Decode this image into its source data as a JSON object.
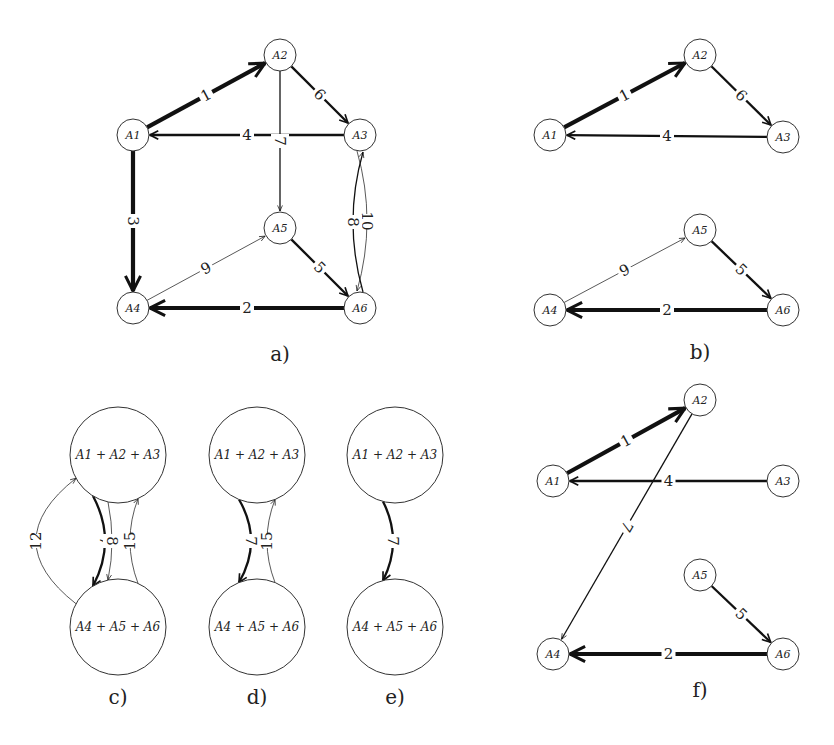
{
  "panels": [
    {
      "id": "a",
      "label": "a)",
      "nodes": [
        {
          "id": "A1",
          "label": "A1"
        },
        {
          "id": "A2",
          "label": "A2"
        },
        {
          "id": "A3",
          "label": "A3"
        },
        {
          "id": "A4",
          "label": "A4"
        },
        {
          "id": "A5",
          "label": "A5"
        },
        {
          "id": "A6",
          "label": "A6"
        }
      ],
      "edges": [
        {
          "from": "A1",
          "to": "A2",
          "weight": "1",
          "width": "heavy"
        },
        {
          "from": "A2",
          "to": "A3",
          "weight": "6",
          "width": "medium"
        },
        {
          "from": "A3",
          "to": "A1",
          "weight": "4",
          "width": "medium"
        },
        {
          "from": "A2",
          "to": "A5",
          "weight": "7",
          "width": "thin"
        },
        {
          "from": "A1",
          "to": "A4",
          "weight": "3",
          "width": "heavy"
        },
        {
          "from": "A4",
          "to": "A5",
          "weight": "9",
          "width": "hairline"
        },
        {
          "from": "A5",
          "to": "A6",
          "weight": "5",
          "width": "medium"
        },
        {
          "from": "A6",
          "to": "A4",
          "weight": "2",
          "width": "heavy"
        },
        {
          "from": "A3",
          "to": "A6",
          "weight": "10",
          "width": "hairline"
        },
        {
          "from": "A6",
          "to": "A3",
          "weight": "8",
          "width": "thin"
        }
      ]
    },
    {
      "id": "b",
      "label": "b)",
      "nodes": [
        {
          "id": "A1",
          "label": "A1"
        },
        {
          "id": "A2",
          "label": "A2"
        },
        {
          "id": "A3",
          "label": "A3"
        },
        {
          "id": "A4",
          "label": "A4"
        },
        {
          "id": "A5",
          "label": "A5"
        },
        {
          "id": "A6",
          "label": "A6"
        }
      ],
      "edges": [
        {
          "from": "A1",
          "to": "A2",
          "weight": "1",
          "width": "heavy"
        },
        {
          "from": "A2",
          "to": "A3",
          "weight": "6",
          "width": "medium"
        },
        {
          "from": "A3",
          "to": "A1",
          "weight": "4",
          "width": "medium"
        },
        {
          "from": "A4",
          "to": "A5",
          "weight": "9",
          "width": "hairline"
        },
        {
          "from": "A5",
          "to": "A6",
          "weight": "5",
          "width": "medium"
        },
        {
          "from": "A6",
          "to": "A4",
          "weight": "2",
          "width": "heavy"
        }
      ]
    },
    {
      "id": "c",
      "label": "c)",
      "nodes": [
        {
          "id": "T",
          "label": "A1 + A2 + A3"
        },
        {
          "id": "B",
          "label": "A4 + A5 + A6"
        }
      ],
      "edges": [
        {
          "from": "B",
          "to": "T",
          "weight": "12",
          "width": "hairline"
        },
        {
          "from": "T",
          "to": "B",
          "weight": "7",
          "width": "medium"
        },
        {
          "from": "T",
          "to": "B",
          "weight": "8",
          "width": "hairline"
        },
        {
          "from": "B",
          "to": "T",
          "weight": "15",
          "width": "hairline"
        }
      ]
    },
    {
      "id": "d",
      "label": "d)",
      "nodes": [
        {
          "id": "T",
          "label": "A1 + A2 + A3"
        },
        {
          "id": "B",
          "label": "A4 + A5 + A6"
        }
      ],
      "edges": [
        {
          "from": "T",
          "to": "B",
          "weight": "7",
          "width": "medium"
        },
        {
          "from": "B",
          "to": "T",
          "weight": "15",
          "width": "hairline"
        }
      ]
    },
    {
      "id": "e",
      "label": "e)",
      "nodes": [
        {
          "id": "T",
          "label": "A1 + A2 + A3"
        },
        {
          "id": "B",
          "label": "A4 + A5 + A6"
        }
      ],
      "edges": [
        {
          "from": "T",
          "to": "B",
          "weight": "7",
          "width": "medium"
        }
      ]
    },
    {
      "id": "f",
      "label": "f)",
      "nodes": [
        {
          "id": "A1",
          "label": "A1"
        },
        {
          "id": "A2",
          "label": "A2"
        },
        {
          "id": "A3",
          "label": "A3"
        },
        {
          "id": "A4",
          "label": "A4"
        },
        {
          "id": "A5",
          "label": "A5"
        },
        {
          "id": "A6",
          "label": "A6"
        }
      ],
      "edges": [
        {
          "from": "A1",
          "to": "A2",
          "weight": "1",
          "width": "heavy"
        },
        {
          "from": "A3",
          "to": "A1",
          "weight": "4",
          "width": "medium"
        },
        {
          "from": "A2",
          "to": "A4",
          "weight": "7",
          "width": "thin"
        },
        {
          "from": "A5",
          "to": "A6",
          "weight": "5",
          "width": "medium"
        },
        {
          "from": "A6",
          "to": "A4",
          "weight": "2",
          "width": "heavy"
        }
      ]
    }
  ]
}
